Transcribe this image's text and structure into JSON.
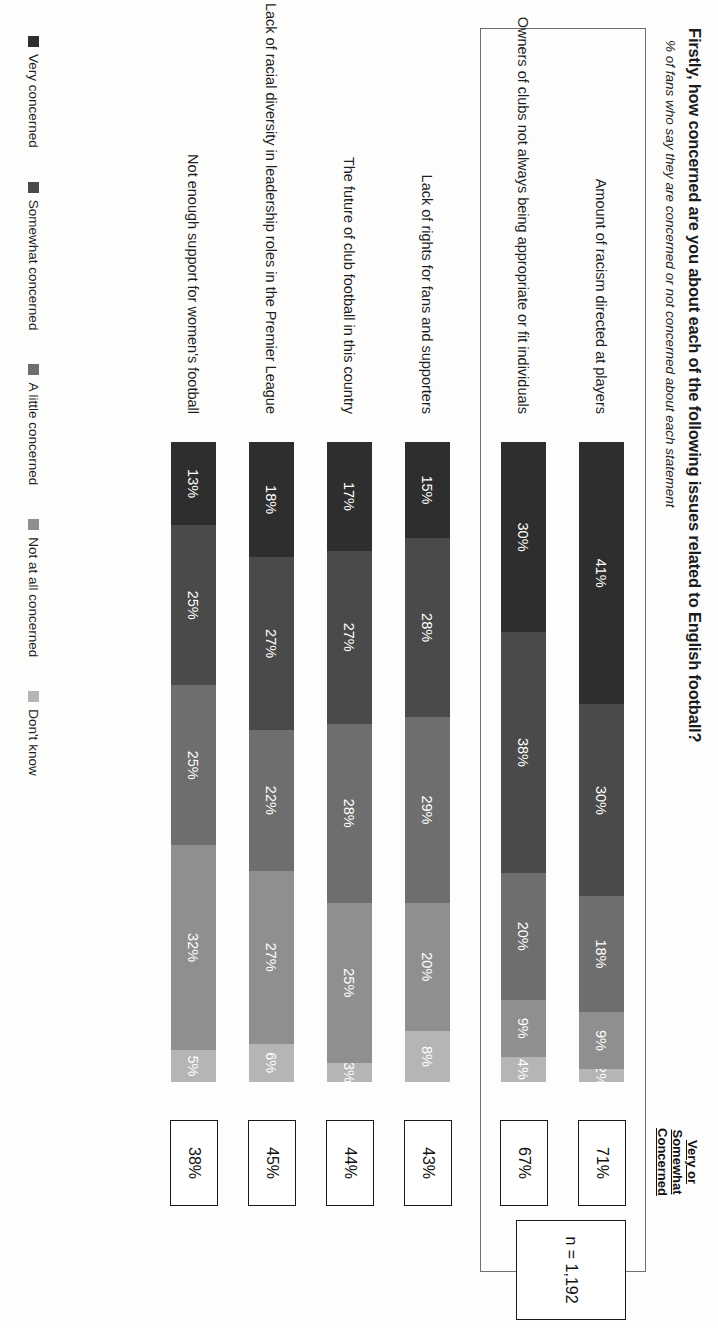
{
  "header": {
    "title": "Firstly, how concerned are you about each of the following issues related to English football?",
    "subtitle": "% of fans who say they are concerned or not concerned about each statement"
  },
  "right_column": {
    "head_line1": "Very or",
    "head_line2": "Somewhat",
    "head_line3": "Concerned",
    "totals": [
      "71%",
      "67%",
      "43%",
      "44%",
      "45%",
      "38%"
    ]
  },
  "sample": {
    "label": "n = 1,192"
  },
  "legend": {
    "items": [
      {
        "label": "Very concerned",
        "color": "#2e2e2e"
      },
      {
        "label": "Somewhat concerned",
        "color": "#4a4a4a"
      },
      {
        "label": "A little concerned",
        "color": "#6e6e6e"
      },
      {
        "label": "Not at all concerned",
        "color": "#8f8f8f"
      },
      {
        "label": "Don't know",
        "color": "#b5b5b5"
      }
    ]
  },
  "chart_data": {
    "type": "bar",
    "title": "Firstly, how concerned are you about each of the following issues related to English football?",
    "subtitle": "% of fans who say they are concerned or not concerned about each statement",
    "orientation": "horizontal",
    "stacked": true,
    "xlabel": "",
    "ylabel": "",
    "xlim": [
      0,
      100
    ],
    "grid": false,
    "legend_position": "bottom",
    "sample_size": "n = 1,192",
    "categories": [
      "Amount of racism directed at players",
      "Owners of clubs not always being appropriate or fit individuals",
      "Lack of rights for fans and supporters",
      "The future of club football in this country",
      "Lack of racial diversity in leadership roles in the Premier League",
      "Not enough support for women's football"
    ],
    "series": [
      {
        "name": "Very concerned",
        "color": "#2e2e2e",
        "values": [
          41,
          30,
          15,
          17,
          18,
          13
        ]
      },
      {
        "name": "Somewhat concerned",
        "color": "#4a4a4a",
        "values": [
          30,
          38,
          28,
          27,
          27,
          25
        ]
      },
      {
        "name": "A little concerned",
        "color": "#6e6e6e",
        "values": [
          18,
          20,
          29,
          28,
          22,
          25
        ]
      },
      {
        "name": "Not at all concerned",
        "color": "#8f8f8f",
        "values": [
          9,
          9,
          20,
          25,
          27,
          32
        ]
      },
      {
        "name": "Don't know",
        "color": "#b5b5b5",
        "values": [
          2,
          4,
          8,
          3,
          6,
          5
        ]
      }
    ],
    "data_labels": [
      [
        "41%",
        "30%",
        "18%",
        "9%",
        "2%"
      ],
      [
        "30%",
        "38%",
        "20%",
        "9%",
        "4%"
      ],
      [
        "15%",
        "28%",
        "29%",
        "20%",
        "8%"
      ],
      [
        "17%",
        "27%",
        "28%",
        "25%",
        "3%"
      ],
      [
        "18%",
        "27%",
        "22%",
        "27%",
        "6%"
      ],
      [
        "13%",
        "25%",
        "25%",
        "32%",
        "5%"
      ]
    ],
    "net_very_or_somewhat": [
      71,
      67,
      43,
      44,
      45,
      38
    ]
  }
}
